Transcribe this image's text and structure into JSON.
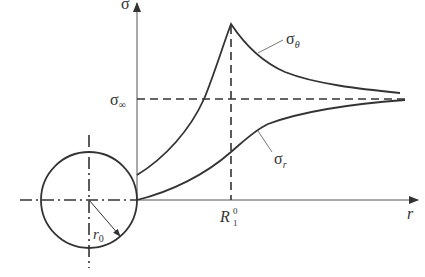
{
  "diagram": {
    "labels": {
      "y_axis": "σ",
      "x_axis": "r",
      "sigma_inf": "σ",
      "sigma_inf_sub": "∞",
      "sigma_theta": "σ",
      "sigma_theta_sub": "θ",
      "sigma_r": "σ",
      "sigma_r_sub": "r",
      "R_main": "R",
      "R_sup": "0",
      "R_sub": "1",
      "r0_main": "r",
      "r0_sub": "0"
    },
    "colors": {
      "line": "#333333",
      "thin": "#555555",
      "background": "#ffffff"
    },
    "curves": {
      "sigma_theta": {
        "description": "tangential stress: starts above zero at opening wall, rises to peak at R1^0, decays toward sigma_inf",
        "points": [
          [
            137,
            175
          ],
          [
            180,
            140
          ],
          [
            204,
            99
          ],
          [
            231,
            24
          ],
          [
            260,
            52
          ],
          [
            300,
            74
          ],
          [
            350,
            85
          ],
          [
            400,
            93
          ]
        ]
      },
      "sigma_r": {
        "description": "radial stress: zero at opening wall, increases monotonically toward sigma_inf",
        "points": [
          [
            137,
            200
          ],
          [
            190,
            180
          ],
          [
            231,
            152
          ],
          [
            260,
            128
          ],
          [
            300,
            115
          ],
          [
            345,
            108
          ],
          [
            405,
            100
          ]
        ]
      }
    }
  }
}
